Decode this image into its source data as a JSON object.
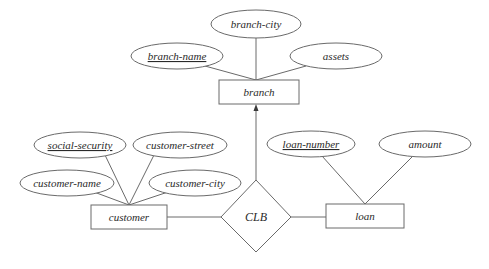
{
  "diagram": {
    "type": "entity-relationship",
    "entities": {
      "branch": {
        "label": "branch"
      },
      "customer": {
        "label": "customer"
      },
      "loan": {
        "label": "loan"
      }
    },
    "relationship": {
      "label": "CLB"
    },
    "attributes": {
      "branch_city": {
        "label": "branch-city",
        "key": false
      },
      "branch_name": {
        "label": "branch-name",
        "key": true
      },
      "assets": {
        "label": "assets",
        "key": false
      },
      "social_security": {
        "label": "social-security",
        "key": true
      },
      "customer_street": {
        "label": "customer-street",
        "key": false
      },
      "customer_name": {
        "label": "customer-name",
        "key": false
      },
      "customer_city": {
        "label": "customer-city",
        "key": false
      },
      "loan_number": {
        "label": "loan-number",
        "key": true
      },
      "amount": {
        "label": "amount",
        "key": false
      }
    },
    "connections": [
      {
        "from": "CLB",
        "to": "branch",
        "arrow": true
      },
      {
        "from": "CLB",
        "to": "customer",
        "arrow": false
      },
      {
        "from": "CLB",
        "to": "loan",
        "arrow": false
      }
    ]
  }
}
